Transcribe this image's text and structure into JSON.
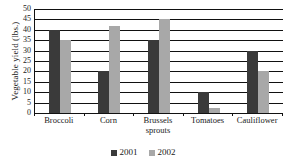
{
  "chart_data": {
    "type": "bar",
    "title": "",
    "xlabel": "",
    "ylabel": "Vegetable yield (lbs.)",
    "ylim": [
      0,
      50
    ],
    "yticks": [
      0,
      5,
      10,
      15,
      20,
      25,
      30,
      35,
      40,
      45,
      50
    ],
    "ytick_labels": [
      "0",
      "5",
      "10",
      "15",
      "20",
      "25",
      "30",
      "35",
      "40",
      "45",
      "50"
    ],
    "grid": true,
    "legend_position": "bottom",
    "categories": [
      "Broccoli",
      "Corn",
      "Brussels sprouts",
      "Tomatoes",
      "Cauliflower"
    ],
    "category_lines": [
      [
        "Broccoli"
      ],
      [
        "Corn"
      ],
      [
        "Brussels",
        "sprouts"
      ],
      [
        "Tomatoes"
      ],
      [
        "Cauliflower"
      ]
    ],
    "series": [
      {
        "name": "2001",
        "color": "#3a3a3a",
        "values": [
          40,
          20,
          35,
          10,
          30
        ]
      },
      {
        "name": "2002",
        "color": "#a8a8a8",
        "values": [
          35,
          42,
          45,
          2.5,
          20
        ]
      }
    ]
  },
  "legend": {
    "entries": [
      {
        "label": "2001"
      },
      {
        "label": "2002"
      }
    ]
  }
}
